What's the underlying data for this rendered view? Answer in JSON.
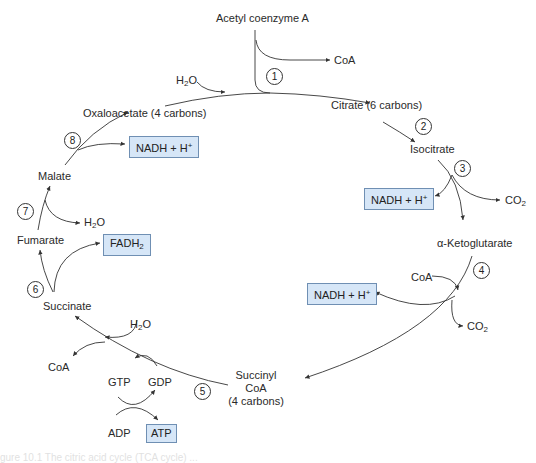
{
  "figure": {
    "title": "Citric acid cycle",
    "caption": "gure 10.1  The citric acid cycle (TCA cycle) ... "
  },
  "compounds": {
    "acetyl_coa": "Acetyl coenzyme A",
    "citrate": "Citrate (6 carbons)",
    "isocitrate": "Isocitrate",
    "alpha_ketoglutarate": "α-Ketoglutarate",
    "succinyl_coa_line1": "Succinyl",
    "succinyl_coa_line2": "CoA",
    "succinyl_coa_line3": "(4 carbons)",
    "succinate": "Succinate",
    "fumarate": "Fumarate",
    "malate": "Malate",
    "oxaloacetate": "Oxaloacetate (4 carbons)"
  },
  "side_labels": {
    "coa_step1": "CoA",
    "h2o_step1": "H",
    "h2o_step1_sub": "2",
    "h2o_step1_tail": "O",
    "co2_step3": "CO",
    "co2_step3_sub": "2",
    "coa_step4": "CoA",
    "co2_step4": "CO",
    "co2_step4_sub": "2",
    "h2o_step5": "H",
    "h2o_step5_sub": "2",
    "h2o_step5_tail": "O",
    "coa_step5": "CoA",
    "gtp": "GTP",
    "gdp": "GDP",
    "adp": "ADP",
    "h2o_step7": "H",
    "h2o_step7_sub": "2",
    "h2o_step7_tail": "O"
  },
  "products": {
    "nadh_step3": "NADH + H",
    "nadh_step3_sup": "+",
    "nadh_step4": "NADH + H",
    "nadh_step4_sup": "+",
    "nadh_step8": "NADH + H",
    "nadh_step8_sup": "+",
    "fadh2": "FADH",
    "fadh2_sub": "2",
    "atp": "ATP"
  },
  "steps": [
    "1",
    "2",
    "3",
    "4",
    "5",
    "6",
    "7",
    "8"
  ],
  "colors": {
    "box_fill": "#d6e6f7",
    "box_border": "#6f8fb3",
    "line": "#333333"
  }
}
